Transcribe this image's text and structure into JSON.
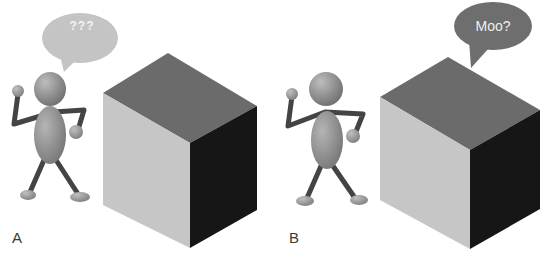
{
  "figure": {
    "panels": [
      {
        "label": "A",
        "speech_bubble": {
          "speaker": "figure",
          "text": "???"
        },
        "objects": [
          "stick-figure",
          "cube"
        ]
      },
      {
        "label": "B",
        "speech_bubble": {
          "speaker": "cube",
          "text": "Moo?"
        },
        "objects": [
          "stick-figure",
          "cube"
        ]
      }
    ],
    "colors": {
      "background": "#ffffff",
      "cube_top": "#6b6b6b",
      "cube_left": "#c6c6c6",
      "cube_right": "#161616",
      "bubble_a": "#c4c4c4",
      "bubble_b": "#6e6e6e",
      "figure_body": "#8a8a8a",
      "figure_limbs": "#444444"
    }
  }
}
